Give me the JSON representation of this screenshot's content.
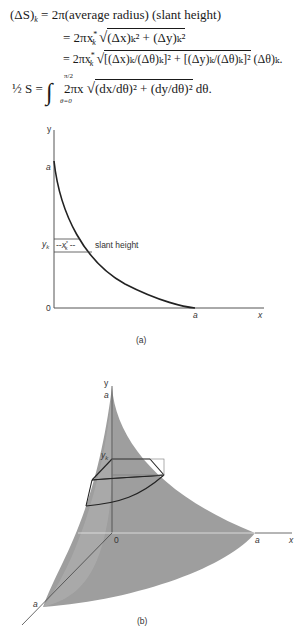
{
  "equations": {
    "line1_lhs": "(ΔS)",
    "line1_lhs_sub": "k",
    "line1_rhs": "= 2π(average radius) (slant height)",
    "line2": "= 2πx",
    "line2_sup": "*",
    "line2_sub": "k",
    "line2_rad": "(Δx)ₖ² + (Δy)ₖ²",
    "line3": "= 2πx",
    "line3_sup": "*",
    "line3_sub": "k",
    "line3_rad": "[(Δx)ₖ/(Δθ)ₖ]² + [(Δy)ₖ/(Δθ)ₖ]²",
    "line3_tail": "(Δθ)ₖ.",
    "line4_lhs": "½ S =",
    "line4_upper": "π/2",
    "line4_lower": "θ=0",
    "line4_body": "2πx",
    "line4_rad": "(dx/dθ)² + (dy/dθ)²",
    "line4_tail": "dθ."
  },
  "figure_a": {
    "y_axis": "y",
    "x_axis": "x",
    "origin": "0",
    "y_intercept": "a",
    "x_intercept": "a",
    "yk_label": "y",
    "yk_sub": "k",
    "xk_label": "x",
    "xk_sub": "k",
    "xk_sup": "*",
    "slant_label": "slant height",
    "caption": "(a)"
  },
  "figure_b": {
    "y_axis": "y",
    "x_axis": "x",
    "origin": "0",
    "top_label": "a",
    "right_label": "a",
    "front_label": "a",
    "yk_label": "y",
    "yk_sub": "k",
    "caption": "(b)",
    "surface_color": "#9e9e9e"
  }
}
